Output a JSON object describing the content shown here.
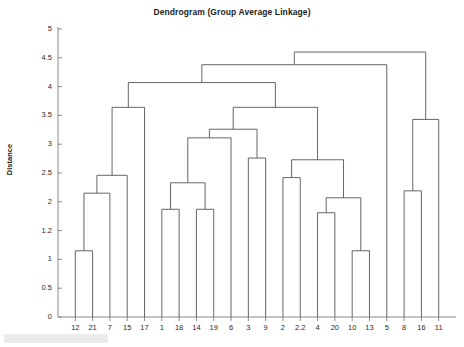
{
  "chart_data": {
    "type": "dendrogram",
    "title": "Dendrogram (Group Average Linkage)",
    "xlabel": "",
    "ylabel": "Distance",
    "ylim": [
      0,
      5
    ],
    "grid": false,
    "legend": null,
    "orientation": "vertical-top-down",
    "linkage_method": "group average",
    "leaf_order": [
      "12",
      "21",
      "7",
      "15",
      "17",
      "1",
      "18",
      "14",
      "19",
      "6",
      "3",
      "9",
      "2",
      "2.2",
      "4",
      "20",
      "10",
      "13",
      "5",
      "8",
      "16",
      "11"
    ],
    "leaf_count": 22,
    "ytick_labels": [
      "0",
      "0.5",
      "1",
      "1.2",
      "2",
      "2.5",
      "3",
      "3.5",
      "4",
      "4.5",
      "5"
    ],
    "ytick_values": [
      0,
      0.5,
      1,
      1.5,
      2,
      2.5,
      3,
      3.5,
      4,
      4.5,
      5
    ],
    "ytick_note": "tick at position 1.5 is labelled 1.2 in the source image",
    "merges": [
      {
        "id": "m1",
        "left": "12",
        "right": "21",
        "height": 1.15
      },
      {
        "id": "m2",
        "left": "m1",
        "right": "7",
        "height": 2.15
      },
      {
        "id": "m3",
        "left": "m2",
        "right": "15",
        "height": 2.46
      },
      {
        "id": "m4",
        "left": "m3",
        "right": "17",
        "height": 3.64
      },
      {
        "id": "m5",
        "left": "1",
        "right": "18",
        "height": 1.87
      },
      {
        "id": "m6",
        "left": "14",
        "right": "19",
        "height": 1.87
      },
      {
        "id": "m7",
        "left": "m5",
        "right": "m6",
        "height": 2.33
      },
      {
        "id": "m8",
        "left": "m7",
        "right": "6",
        "height": 3.11
      },
      {
        "id": "m9",
        "left": "3",
        "right": "9",
        "height": 2.76
      },
      {
        "id": "m10",
        "left": "m8",
        "right": "m9",
        "height": 3.26
      },
      {
        "id": "m11",
        "left": "2",
        "right": "2.2",
        "height": 2.42
      },
      {
        "id": "m12",
        "left": "4",
        "right": "20",
        "height": 1.81
      },
      {
        "id": "m13",
        "left": "10",
        "right": "13",
        "height": 1.15
      },
      {
        "id": "m14",
        "left": "m12",
        "right": "m13",
        "height": 2.07
      },
      {
        "id": "m15",
        "left": "m11",
        "right": "m14",
        "height": 2.73
      },
      {
        "id": "m16",
        "left": "m10",
        "right": "m15",
        "height": 3.64
      },
      {
        "id": "m17",
        "left": "m4",
        "right": "m16",
        "height": 4.07
      },
      {
        "id": "m18",
        "left": "8",
        "right": "16",
        "height": 2.19
      },
      {
        "id": "m19",
        "left": "m18",
        "right": "11",
        "height": 3.43
      },
      {
        "id": "m20",
        "left": "m17",
        "right": "5",
        "height": 4.38
      },
      {
        "id": "m21",
        "left": "m20",
        "right": "m19",
        "height": 4.6
      }
    ],
    "colors": {
      "line": "#555555",
      "axis": "#8a8a8a",
      "text": "#1c1c1c",
      "background": "#ffffff"
    }
  }
}
